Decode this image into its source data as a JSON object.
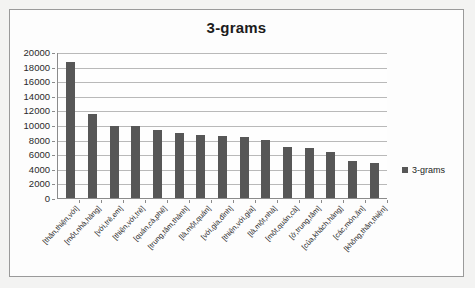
{
  "chart_data": {
    "type": "bar",
    "title": "3-grams",
    "xlabel": "",
    "ylabel": "",
    "ylim": [
      0,
      20000
    ],
    "ytick_step": 2000,
    "yticks": [
      20000,
      18000,
      16000,
      14000,
      12000,
      10000,
      8000,
      6000,
      4000,
      2000,
      0
    ],
    "grid": true,
    "legend_position": "right",
    "legend": [
      "3-grams"
    ],
    "series_color": "#575757",
    "categories": [
      "[thân,thiện,với]",
      "[một,nhà,hàng]",
      "[với,trẻ,em]",
      "[thiện,với,trẻ]",
      "[quán,cà,phê]",
      "[trung,tâm,thành]",
      "[là,một,quán]",
      "[với,gia,đình]",
      "[thiện,với,gia]",
      "[là,một,nhà]",
      "[một,quán,cà]",
      "[ở,trung,tâm]",
      "[của,khách,hàng]",
      "[các,món,ăn]",
      "[không,thân,thiện]"
    ],
    "series": [
      {
        "name": "3-grams",
        "values": [
          18700,
          11450,
          9850,
          9850,
          9300,
          8850,
          8600,
          8500,
          8400,
          8000,
          7050,
          6900,
          6300,
          5050,
          4850
        ]
      }
    ]
  },
  "legend": {
    "marker_name": "square-marker",
    "label": "3-grams"
  }
}
